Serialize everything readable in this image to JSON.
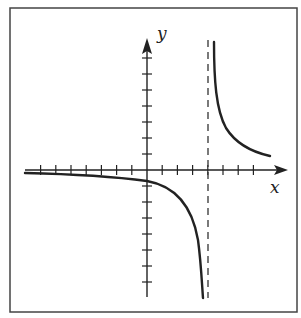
{
  "chart_data": {
    "type": "line",
    "title": "",
    "xlabel": "x",
    "ylabel": "y",
    "grid": false,
    "legend": null,
    "axis_ticks": {
      "x_left_count": 7,
      "x_right_count": 7,
      "y_up_count": 7,
      "y_down_count": 7,
      "tick_labels": []
    },
    "asymptotes": {
      "vertical": {
        "x": 4,
        "style": "dashed"
      },
      "horizontal": {
        "y": 0
      }
    },
    "xlim": [
      -8,
      8.5
    ],
    "ylim": [
      -7.8,
      8.5
    ],
    "series": [
      {
        "name": "left-branch",
        "points": [
          [
            -8,
            -0.2
          ],
          [
            -6,
            -0.25
          ],
          [
            -4,
            -0.3
          ],
          [
            -2,
            -0.4
          ],
          [
            0,
            -0.6
          ],
          [
            1,
            -0.8
          ],
          [
            2,
            -1.2
          ],
          [
            3,
            -2.2
          ],
          [
            3.5,
            -3.8
          ],
          [
            3.7,
            -7.8
          ]
        ]
      },
      {
        "name": "right-branch",
        "points": [
          [
            4.4,
            8.5
          ],
          [
            4.6,
            6.0
          ],
          [
            5,
            3.6
          ],
          [
            5.5,
            2.4
          ],
          [
            6,
            1.8
          ],
          [
            7,
            1.2
          ],
          [
            8,
            0.9
          ]
        ]
      }
    ]
  },
  "labels": {
    "x_axis": "x",
    "y_axis": "y"
  },
  "colors": {
    "ink": "#222222",
    "frame": "#444444",
    "background": "#ffffff"
  }
}
